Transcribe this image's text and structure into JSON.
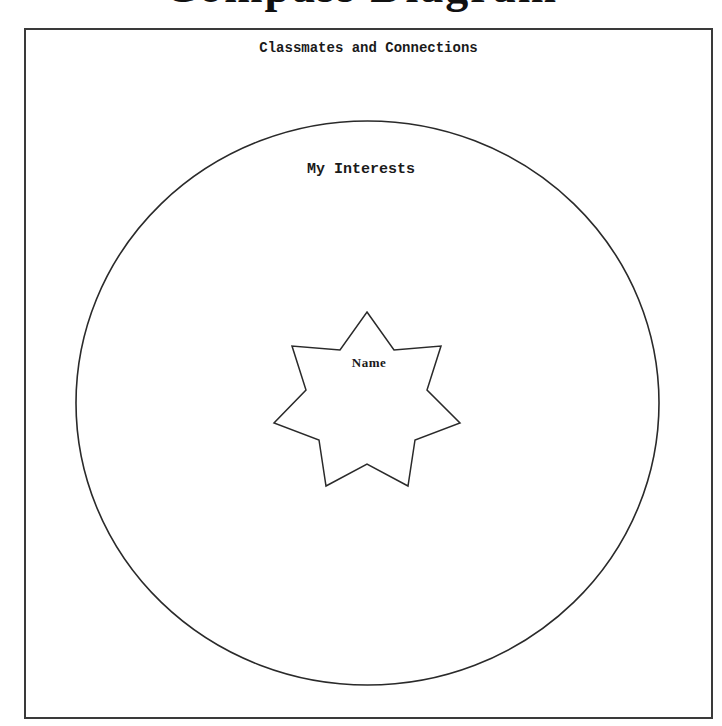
{
  "page": {
    "heading_clipped": "Compass Diagram"
  },
  "frame": {
    "title": "Classmates and Connections"
  },
  "diagram": {
    "circle_label": "My Interests",
    "star_label": "Name",
    "stroke_color": "#2a2a2a",
    "background_color": "#ffffff"
  }
}
